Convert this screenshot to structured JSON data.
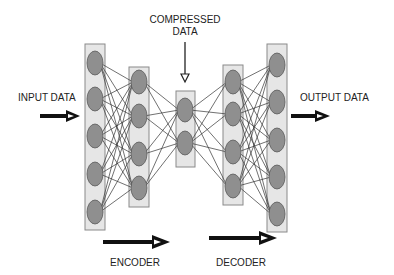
{
  "labels": {
    "compressed_line1": "COMPRESSED",
    "compressed_line2": "DATA",
    "input": "INPUT DATA",
    "output": "OUTPUT DATA",
    "encoder": "ENCODER",
    "decoder": "DECODER"
  },
  "colors": {
    "layer_fill": "#e6e6e6",
    "layer_stroke": "#8a8a8a",
    "node_fill": "#8f8f8f",
    "node_stroke": "#5a5a5a",
    "edge": "#333333",
    "arrow": "#111111"
  },
  "layers": [
    {
      "name": "input-layer",
      "rect": [
        85,
        44,
        20,
        186
      ],
      "cx": 95,
      "nodes": [
        63,
        99,
        136,
        174,
        212
      ]
    },
    {
      "name": "encoder-hidden-layer",
      "rect": [
        129,
        67,
        20,
        140
      ],
      "cx": 139,
      "nodes": [
        82,
        116,
        154,
        188
      ]
    },
    {
      "name": "bottleneck-layer",
      "rect": [
        176,
        91,
        19,
        76
      ],
      "cx": 185,
      "nodes": [
        110,
        143
      ]
    },
    {
      "name": "decoder-hidden-layer",
      "rect": [
        223,
        65,
        20,
        140
      ],
      "cx": 233,
      "nodes": [
        82,
        114,
        152,
        186
      ]
    },
    {
      "name": "output-layer",
      "rect": [
        267,
        44,
        20,
        188
      ],
      "cx": 277,
      "nodes": [
        65,
        102,
        140,
        177,
        214
      ]
    }
  ],
  "node_radius": [
    8,
    12
  ]
}
